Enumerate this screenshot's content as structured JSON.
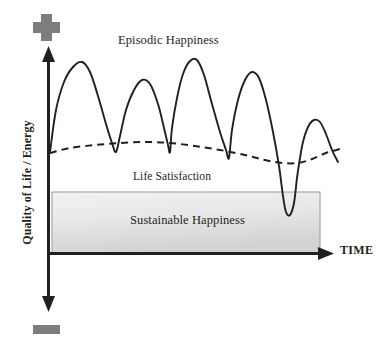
{
  "figure": {
    "background_color": "#ffffff",
    "ink_color": "#231f20",
    "marker_color": "#808080"
  },
  "axes": {
    "y_label": "Quality of Life / Energy",
    "x_label": "TIME",
    "positive_marker_name": "plus-sign",
    "negative_marker_name": "minus-sign"
  },
  "labels": {
    "episodic": "Episodic Happiness",
    "life_satisfaction": "Life Satisfaction",
    "sustainable": "Sustainable Happiness"
  },
  "chart_data": {
    "type": "line",
    "title": "",
    "xlabel": "TIME",
    "ylabel": "Quality of Life / Energy",
    "grid": false,
    "legend": "inline-annotations",
    "axis_notes": {
      "y_positive_end": "+",
      "y_negative_end": "−",
      "x_arrow": true,
      "y_arrow_both_ends": true,
      "tick_labels": []
    },
    "series": [
      {
        "name": "Episodic Happiness",
        "style": "solid",
        "color": "#231f20",
        "description": "Oscillating curve with five tall peaks and one deep trough dropping into the Sustainable Happiness band",
        "points": [
          [
            50,
            152
          ],
          [
            56,
            110
          ],
          [
            64,
            82
          ],
          [
            73,
            67
          ],
          [
            82,
            62
          ],
          [
            90,
            72
          ],
          [
            98,
            96
          ],
          [
            106,
            124
          ],
          [
            112,
            143
          ],
          [
            116,
            152
          ],
          [
            120,
            136
          ],
          [
            126,
            110
          ],
          [
            134,
            90
          ],
          [
            142,
            80
          ],
          [
            150,
            84
          ],
          [
            158,
            104
          ],
          [
            164,
            128
          ],
          [
            168,
            145
          ],
          [
            170,
            152
          ],
          [
            172,
            128
          ],
          [
            177,
            98
          ],
          [
            183,
            74
          ],
          [
            190,
            61
          ],
          [
            197,
            60
          ],
          [
            204,
            75
          ],
          [
            212,
            104
          ],
          [
            220,
            132
          ],
          [
            226,
            150
          ],
          [
            229,
            158
          ],
          [
            232,
            130
          ],
          [
            238,
            100
          ],
          [
            245,
            80
          ],
          [
            252,
            72
          ],
          [
            259,
            78
          ],
          [
            266,
            100
          ],
          [
            273,
            132
          ],
          [
            279,
            166
          ],
          [
            283,
            196
          ],
          [
            286,
            212
          ],
          [
            290,
            215
          ],
          [
            294,
            203
          ],
          [
            297,
            178
          ],
          [
            300,
            158
          ],
          [
            303,
            142
          ],
          [
            308,
            127
          ],
          [
            314,
            120
          ],
          [
            320,
            122
          ],
          [
            326,
            134
          ],
          [
            332,
            150
          ],
          [
            338,
            162
          ]
        ]
      },
      {
        "name": "Life Satisfaction",
        "style": "dashed",
        "color": "#231f20",
        "description": "Gently undulating dashed baseline hovering near the top of the Sustainable Happiness band",
        "points": [
          [
            50,
            153
          ],
          [
            70,
            148
          ],
          [
            95,
            145
          ],
          [
            120,
            143
          ],
          [
            145,
            142
          ],
          [
            170,
            143
          ],
          [
            195,
            146
          ],
          [
            220,
            150
          ],
          [
            245,
            155
          ],
          [
            265,
            160
          ],
          [
            282,
            163
          ],
          [
            298,
            163
          ],
          [
            312,
            159
          ],
          [
            326,
            153
          ],
          [
            340,
            149
          ]
        ]
      }
    ],
    "regions": [
      {
        "name": "Sustainable Happiness",
        "type": "band",
        "x_range": [
          52,
          320
        ],
        "y_range": [
          192,
          253
        ],
        "fill": "#e3e3e3",
        "border": "#9a9a9a"
      }
    ]
  }
}
